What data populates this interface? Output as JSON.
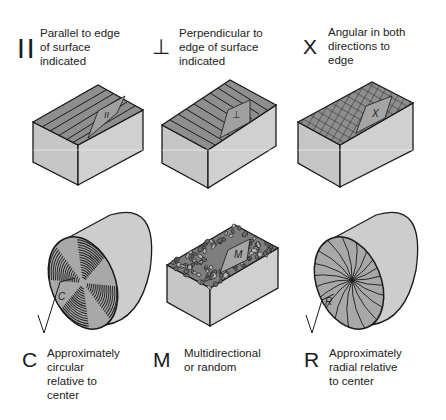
{
  "items": [
    {
      "symbol": "| |",
      "symbol_name": "parallel",
      "description_lines": [
        "Parallel to edge",
        "of surface",
        "indicated"
      ],
      "figure_label": "II",
      "figure": "block with grooves parallel to edge"
    },
    {
      "symbol": "⊥",
      "symbol_name": "perpendicular",
      "description_lines": [
        "Perpendicular to",
        "edge of surface",
        "indicated"
      ],
      "figure_label": "⊥",
      "figure": "block with grooves perpendicular to edge"
    },
    {
      "symbol": "X",
      "symbol_name": "angular",
      "description_lines": [
        "Angular in both",
        "directions to",
        "edge"
      ],
      "figure_label": "X",
      "figure": "block with crosshatched surface"
    },
    {
      "symbol": "C",
      "symbol_name": "circular",
      "description_lines": [
        "Approximately",
        "circular",
        "relative to",
        "center"
      ],
      "figure_label": "C",
      "figure": "cylinder face with concentric lay"
    },
    {
      "symbol": "M",
      "symbol_name": "multidirectional",
      "description_lines": [
        "Multidirectional",
        "or random"
      ],
      "figure_label": "M",
      "figure": "block with random lay"
    },
    {
      "symbol": "R",
      "symbol_name": "radial",
      "description_lines": [
        "Approximately",
        "radial relative",
        "to center"
      ],
      "figure_label": "R",
      "figure": "cylinder face with radial lay"
    }
  ],
  "colors": {
    "top_surface": "#8a8a8a",
    "side_face": "#c4c4c4",
    "front_face": "#cfcfcf",
    "outline": "#1a1a1a"
  }
}
